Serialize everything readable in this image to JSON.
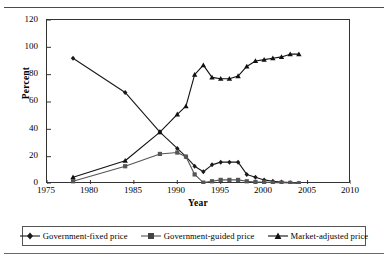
{
  "figure": {
    "top_caption": "",
    "y_axis_label": "Percent",
    "x_axis_label": "Year"
  },
  "legend": {
    "items": [
      {
        "label": "Government-fixed price",
        "marker": "diamond-marker",
        "color": "#1a1a1a"
      },
      {
        "label": "Government-guided price",
        "marker": "square-marker",
        "color": "#555555"
      },
      {
        "label": "Market-adjusted price",
        "marker": "triangle-marker",
        "color": "#111111"
      }
    ]
  },
  "chart_data": {
    "type": "line",
    "title": "",
    "xlabel": "Year",
    "ylabel": "Percent",
    "xlim": [
      1975,
      2010
    ],
    "ylim": [
      0,
      120
    ],
    "xticks": [
      1975,
      1980,
      1985,
      1990,
      1995,
      2000,
      2005,
      2010
    ],
    "yticks": [
      0,
      20,
      40,
      60,
      80,
      100,
      120
    ],
    "grid": false,
    "legend_position": "bottom",
    "series": [
      {
        "name": "Government-fixed price",
        "marker": "diamond",
        "color": "#1a1a1a",
        "x": [
          1978,
          1984,
          1988,
          1990,
          1991,
          1992,
          1993,
          1994,
          1995,
          1996,
          1997,
          1998,
          1999,
          2000,
          2001,
          2002,
          2003,
          2004
        ],
        "y": [
          92,
          67,
          38,
          26,
          20,
          13,
          9,
          14,
          16,
          16,
          16,
          7,
          5,
          3,
          2,
          1.5,
          1,
          0.5
        ]
      },
      {
        "name": "Government-guided price",
        "marker": "square",
        "color": "#555555",
        "x": [
          1978,
          1984,
          1988,
          1990,
          1991,
          1992,
          1993,
          1994,
          1995,
          1996,
          1997,
          1998,
          1999,
          2000,
          2001,
          2002,
          2003,
          2004
        ],
        "y": [
          2,
          13,
          22,
          23,
          20,
          7,
          1,
          2,
          3,
          3,
          3,
          2,
          1.5,
          1.5,
          1,
          1,
          0.8,
          0.5
        ]
      },
      {
        "name": "Market-adjusted price",
        "marker": "triangle",
        "color": "#111111",
        "x": [
          1978,
          1984,
          1988,
          1990,
          1991,
          1992,
          1993,
          1994,
          1995,
          1996,
          1997,
          1998,
          1999,
          2000,
          2001,
          2002,
          2003,
          2004
        ],
        "y": [
          5,
          17,
          38,
          51,
          57,
          80,
          87,
          78,
          77,
          77,
          79,
          86,
          90,
          91,
          92,
          93,
          95,
          95
        ]
      }
    ]
  }
}
